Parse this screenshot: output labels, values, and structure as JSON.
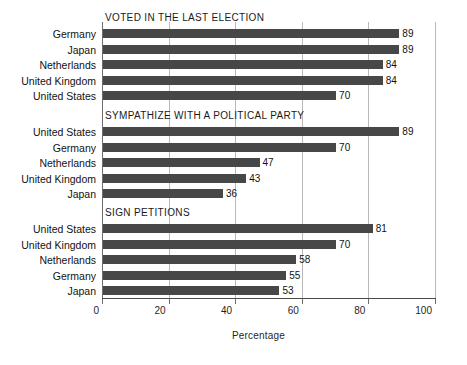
{
  "chart_data": {
    "type": "bar",
    "orientation": "horizontal",
    "title": "",
    "xlabel": "Percentage",
    "ylabel": "",
    "xlim": [
      0,
      100
    ],
    "xticks": [
      0,
      20,
      40,
      60,
      80,
      100
    ],
    "xtick_labels": [
      "0",
      "20",
      "40",
      "60",
      "80",
      "100"
    ],
    "grid": "vertical",
    "legend": "none",
    "panels": [
      {
        "title": "VOTED IN THE LAST ELECTION",
        "categories": [
          "Germany",
          "Japan",
          "Netherlands",
          "United Kingdom",
          "United States"
        ],
        "values": [
          89,
          89,
          84,
          84,
          70
        ]
      },
      {
        "title": "SYMPATHIZE WITH A POLITICAL PARTY",
        "categories": [
          "United States",
          "Germany",
          "Netherlands",
          "United Kingdom",
          "Japan"
        ],
        "values": [
          89,
          70,
          47,
          43,
          36
        ]
      },
      {
        "title": "SIGN PETITIONS",
        "categories": [
          "United States",
          "United Kingdom",
          "Netherlands",
          "Germany",
          "Japan"
        ],
        "values": [
          81,
          70,
          58,
          55,
          53
        ]
      }
    ],
    "colors": {
      "bar": "#474747",
      "gridline": "#b9b9b9",
      "axis": "#4a4a4a",
      "text": "#121212",
      "background": "#ffffff"
    }
  }
}
